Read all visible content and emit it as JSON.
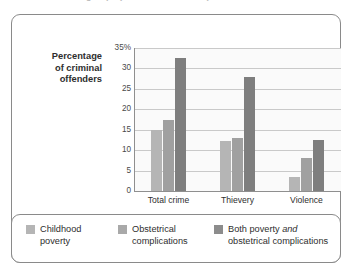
{
  "caption": {
    "text": "groups (based on Table 17.3)."
  },
  "chart_data": {
    "type": "bar",
    "title": "",
    "subtitle": "",
    "xlabel": "",
    "ylabel": "Percentage of criminal offenders",
    "ylabel_lines": [
      "Percentage",
      "of criminal",
      "offenders"
    ],
    "categories": [
      "Total crime",
      "Thievery",
      "Violence"
    ],
    "series": [
      {
        "name": "Childhood poverty",
        "values": [
          15,
          12.3,
          3.5
        ]
      },
      {
        "name": "Obstetrical complications",
        "values": [
          17.5,
          13,
          8
        ]
      },
      {
        "name": "Both poverty and obstetrical complications",
        "values": [
          32.5,
          28,
          12.5
        ]
      }
    ],
    "ylim": [
      0,
      35
    ],
    "yticks": [
      "35%",
      "30",
      "25",
      "20",
      "15",
      "10",
      "5",
      "0"
    ],
    "ytick_values": [
      35,
      30,
      25,
      20,
      15,
      10,
      5,
      0
    ],
    "grid": true,
    "legend_position": "bottom",
    "colors": {
      "series_0": "#b5b5b5",
      "series_1": "#a0a0a0",
      "series_2": "#7e7e7e",
      "gridline": "#c9c9c9",
      "axis": "#8f8f8f",
      "plot_background": "#fafafa",
      "border": "#8a8a8a",
      "text": "#2e2e2e"
    }
  },
  "legend": {
    "items": [
      {
        "label_line1": "Childhood",
        "label_line2": "poverty",
        "emphasis": ""
      },
      {
        "label_line1": "Obstetrical",
        "label_line2": "complications",
        "emphasis": ""
      },
      {
        "label_line1_pre": "Both poverty ",
        "label_line1_em": "and",
        "label_line2": "obstetrical complications"
      }
    ]
  }
}
